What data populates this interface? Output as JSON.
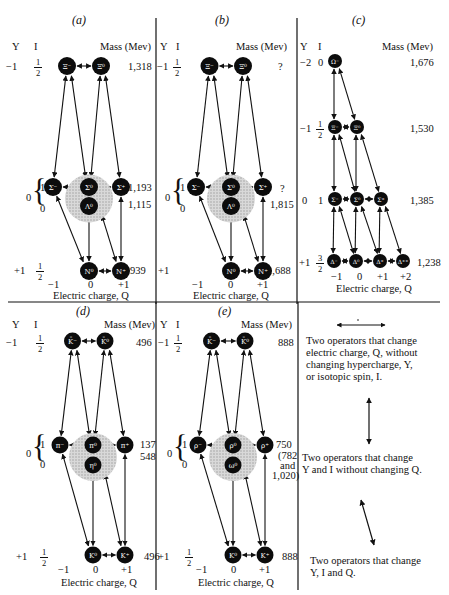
{
  "panels": [
    {
      "id": "a",
      "label": "(a)",
      "y_header": "Y",
      "i_header": "I",
      "mass_header": "Mass (Mev)",
      "rows": [
        {
          "Y": "−1",
          "I_num": "1",
          "I_den": "2",
          "mass": "1,318",
          "particles": [
            "Ξ⁻",
            "Ξ⁰"
          ]
        },
        {
          "Y": "0",
          "I_upper": "1",
          "I_lower": "0",
          "mass_upper": "1,193",
          "mass_lower": "1,115",
          "particles": [
            "Σ⁻",
            "Σ⁰",
            "Σ⁺",
            "Λ⁰"
          ]
        },
        {
          "Y": "+1",
          "I_num": "1",
          "I_den": "2",
          "mass": "939",
          "particles": [
            "N⁰",
            "N⁺"
          ]
        }
      ],
      "q_ticks": [
        "−1",
        "0",
        "+1"
      ],
      "xlabel": "Electric charge, Q"
    },
    {
      "id": "b",
      "label": "(b)",
      "y_header": "Y",
      "i_header": "I",
      "mass_header": "Mass (Mev)",
      "rows": [
        {
          "Y": "−1",
          "I_num": "1",
          "I_den": "2",
          "mass": "?",
          "particles": [
            "Ξ⁻",
            "Ξ⁰"
          ]
        },
        {
          "Y": "0",
          "I_upper": "1",
          "I_lower": "0",
          "mass_upper": "?",
          "mass_lower": "1,815",
          "particles": [
            "Σ⁻",
            "Σ⁰",
            "Σ⁺",
            "Λ⁰"
          ]
        },
        {
          "Y": "+1",
          "mass": "1,688",
          "particles": [
            "N⁰",
            "N⁺"
          ]
        }
      ],
      "q_ticks": [
        "−1",
        "0",
        "+1"
      ],
      "xlabel": "Electric charge, Q"
    },
    {
      "id": "c",
      "label": "(c)",
      "y_header": "Y",
      "i_header": "I",
      "mass_header": "Mass (Mev)",
      "rows": [
        {
          "Y": "−2",
          "I": "0",
          "mass": "1,676",
          "particles": [
            "Ω⁻"
          ]
        },
        {
          "Y": "−1",
          "I_num": "1",
          "I_den": "2",
          "mass": "1,530",
          "particles": [
            "Ξ⁻",
            "Ξ⁰"
          ]
        },
        {
          "Y": "0",
          "I": "1",
          "mass": "1,385",
          "particles": [
            "Σ⁻",
            "Σ⁰",
            "Σ⁺"
          ]
        },
        {
          "Y": "+1",
          "I_num": "3",
          "I_den": "2",
          "mass": "1,238",
          "particles": [
            "Δ⁻",
            "Δ⁰",
            "Δ⁺",
            "Δ⁺⁺"
          ]
        }
      ],
      "q_ticks": [
        "−1",
        "0",
        "+1",
        "+2"
      ],
      "xlabel": "Electric charge, Q"
    },
    {
      "id": "d",
      "label": "(d)",
      "y_header": "Y",
      "i_header": "I",
      "mass_header": "Mass (Mev)",
      "rows": [
        {
          "Y": "−1",
          "I_num": "1",
          "I_den": "2",
          "mass": "496",
          "particles": [
            "K̄⁻",
            "K̄⁰"
          ]
        },
        {
          "Y": "0",
          "I_upper": "1",
          "I_lower": "0",
          "mass_upper": "137",
          "mass_lower": "548",
          "particles": [
            "π⁻",
            "π⁰",
            "π⁺",
            "η⁰"
          ]
        },
        {
          "Y": "+1",
          "I_num": "1",
          "I_den": "2",
          "mass": "496",
          "particles": [
            "K⁰",
            "K⁺"
          ]
        }
      ],
      "q_ticks": [
        "−1",
        "0",
        "+1"
      ],
      "xlabel": "Electric charge, Q"
    },
    {
      "id": "e",
      "label": "(e)",
      "y_header": "Y",
      "i_header": "I",
      "mass_header": "Mass (Mev)",
      "rows": [
        {
          "Y": "−1",
          "I_num": "1",
          "I_den": "2",
          "mass": "888",
          "particles": [
            "K̄⁻",
            "K̄⁰"
          ]
        },
        {
          "Y": "0",
          "I_upper": "1",
          "I_lower": "0",
          "mass_upper": "750",
          "mass_lower_lines": [
            "(782",
            "and",
            "1,020)"
          ],
          "particles": [
            "ρ⁻",
            "ρ⁰",
            "ρ⁺",
            "ω⁰"
          ]
        },
        {
          "Y": "+1",
          "I_num": "1",
          "I_den": "2",
          "mass": "888",
          "particles": [
            "K⁰",
            "K⁺"
          ]
        }
      ],
      "q_ticks": [
        "−1",
        "0",
        "+1"
      ],
      "xlabel": "Electric charge, Q"
    }
  ],
  "legend": [
    {
      "icon": "horizontal-double-arrow-icon",
      "lines": [
        "Two operators that change",
        "electric charge, Q, without",
        "changing hypercharge, Y,",
        "or isotopic spin, I."
      ]
    },
    {
      "icon": "vertical-double-arrow-icon",
      "lines": [
        "Two operators that change",
        "Y and I without changing Q."
      ]
    },
    {
      "icon": "diagonal-double-arrow-icon",
      "lines": [
        "Two operators that change",
        "Y, I and Q."
      ]
    }
  ]
}
